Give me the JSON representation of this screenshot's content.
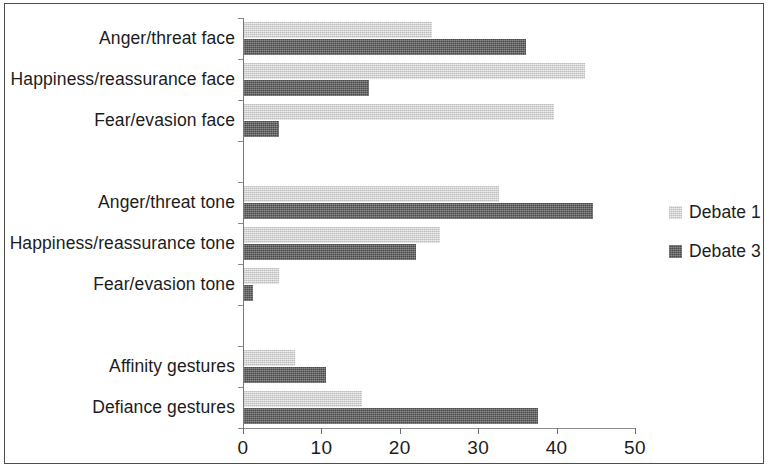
{
  "chart_data": {
    "type": "bar",
    "orientation": "horizontal",
    "title": "",
    "subtitle": "",
    "xlabel": "",
    "ylabel": "",
    "xlim": [
      0,
      50
    ],
    "xticks": [
      0,
      10,
      20,
      30,
      40,
      50
    ],
    "xtick_labels": [
      "0",
      "10",
      "20",
      "30",
      "40",
      "50"
    ],
    "grid": false,
    "legend_position": "right",
    "categories": [
      "Anger/threat face",
      "Happiness/reassurance face",
      "Fear/evasion face",
      "",
      "Anger/threat tone",
      "Happiness/reassurance tone",
      "Fear/evasion tone",
      "",
      "Affinity gestures",
      "Defiance gestures"
    ],
    "series": [
      {
        "name": "Debate 1",
        "color": "#d2d2d2",
        "values": [
          24,
          43.5,
          39.5,
          null,
          32.5,
          25,
          4.5,
          null,
          6.5,
          15
        ]
      },
      {
        "name": "Debate 3",
        "color": "#4a4a4a",
        "values": [
          36,
          16,
          4.5,
          null,
          44.5,
          22,
          1.2,
          null,
          10.5,
          37.5
        ]
      }
    ]
  },
  "legend": {
    "entries": [
      {
        "label": "Debate 1",
        "color": "#d2d2d2"
      },
      {
        "label": "Debate 3",
        "color": "#4a4a4a"
      }
    ]
  }
}
